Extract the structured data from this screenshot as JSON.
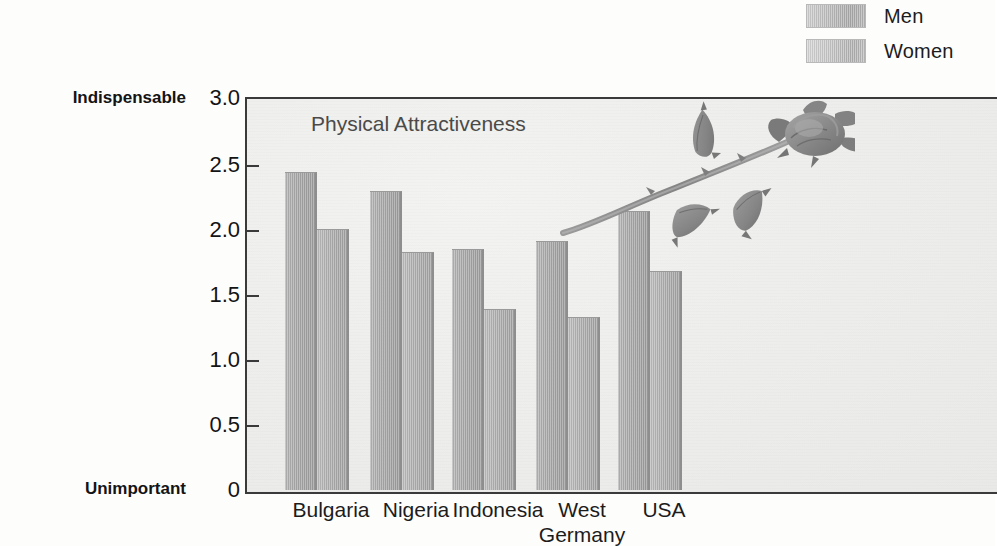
{
  "chart_data": {
    "type": "bar",
    "title": "Physical Attractiveness",
    "xlabel": "",
    "ylabel": "",
    "categories": [
      "Bulgaria",
      "Nigeria",
      "Indonesia",
      "West\nGermany",
      "USA"
    ],
    "series": [
      {
        "name": "Men",
        "values": [
          2.43,
          2.28,
          1.84,
          1.9,
          2.13
        ]
      },
      {
        "name": "Women",
        "values": [
          1.99,
          1.82,
          1.38,
          1.32,
          1.67
        ]
      }
    ],
    "ylim": [
      0,
      3.0
    ],
    "ytick_labels": [
      "3.0",
      "2.5",
      "2.0",
      "1.5",
      "1.0",
      "0.5",
      "0"
    ],
    "ytick_values": [
      3.0,
      2.5,
      2.0,
      1.5,
      1.0,
      0.5,
      0
    ],
    "y_axis_top_caption": "Indispensable",
    "y_axis_bottom_caption": "Unimportant",
    "grid": false,
    "legend_position": "top-right",
    "colors": {
      "men_bar": "#a8a8a8",
      "women_bar": "#b0b0b0",
      "plot_background": "#eeeeec",
      "axis": "#3a3a3a",
      "text": "#1c1c1c",
      "title_text": "#4a4a4a"
    }
  },
  "legend": {
    "items": [
      {
        "label": "Men",
        "swatch": "men-swatch"
      },
      {
        "label": "Women",
        "swatch": "women-swatch"
      }
    ]
  },
  "axis": {
    "top_caption": "Indispensable",
    "bottom_caption": "Unimportant",
    "ticks": [
      {
        "label": "3.0"
      },
      {
        "label": "2.5"
      },
      {
        "label": "2.0"
      },
      {
        "label": "1.5"
      },
      {
        "label": "1.0"
      },
      {
        "label": "0.5"
      },
      {
        "label": "0"
      }
    ]
  },
  "plot": {
    "title": "Physical Attractiveness",
    "categories": [
      {
        "label": "Bulgaria"
      },
      {
        "label": "Nigeria"
      },
      {
        "label": "Indonesia"
      },
      {
        "label": "West\nGermany"
      },
      {
        "label": "USA"
      }
    ]
  },
  "decoration": {
    "rose": "rose-illustration"
  }
}
